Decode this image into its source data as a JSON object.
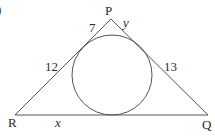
{
  "figure": {
    "partial_label": ")",
    "vertices": [
      {
        "name": "P",
        "x": 111,
        "y": 19
      },
      {
        "name": "R",
        "x": 15,
        "y": 115
      },
      {
        "name": "Q",
        "x": 208,
        "y": 115
      }
    ],
    "incircle": {
      "cx": 112,
      "cy": 75,
      "r": 40
    },
    "segment_labels": {
      "p_left": "7",
      "p_right": "y",
      "r_upper": "12",
      "q_upper": "13",
      "r_bottom": "x"
    },
    "vertex_labels": {
      "P": "P",
      "R": "R",
      "Q": "Q"
    },
    "colors": {
      "line": "#555555",
      "text": "#2a2a2a",
      "background": "#ffffff"
    }
  }
}
